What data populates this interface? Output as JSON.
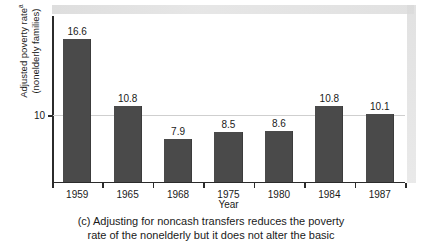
{
  "chart_data": {
    "type": "bar",
    "title": "",
    "categories": [
      "1959",
      "1965",
      "1968",
      "1975",
      "1980",
      "1984",
      "1987"
    ],
    "values": [
      16.6,
      10.8,
      7.9,
      8.5,
      8.6,
      10.8,
      10.1
    ],
    "value_labels": [
      "16.6",
      "10.8",
      "7.9",
      "8.5",
      "8.6",
      "10.8",
      "10.1"
    ],
    "xlabel": "Year",
    "ylabel": "Adjusted poverty rate",
    "ylabel_superscript": "a",
    "ylabel_line2": "(nonelderly families)",
    "ytick_labels": [
      "10"
    ],
    "ytick_values": [
      10
    ],
    "ylim": [
      4.2,
      18.6
    ],
    "grid": "horizontal-single",
    "legend": "none",
    "bar_color": "#4a4a4a",
    "axis_color": "#2b2b2b",
    "gridline_color": "#cfcfcf"
  },
  "caption": {
    "line1": "(c) Adjusting for noncash transfers reduces the poverty",
    "line2": "rate of the nonelderly but it does not alter the basic"
  }
}
